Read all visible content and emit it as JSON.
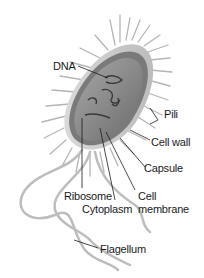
{
  "diagram": {
    "labels": {
      "dna": "DNA",
      "pili": "Pili",
      "cell_wall": "Cell wall",
      "capsule": "Capsule",
      "ribosome": "Ribosome",
      "cell_membrane_line1": "Cell",
      "cell_membrane_line2": "membrane",
      "cytoplasm": "Cytoplasm",
      "flagellum": "Flagellum"
    },
    "colors": {
      "background": "#ffffff",
      "body_fill": "#8a8a8a",
      "body_dark": "#555555",
      "capsule_light": "#cfcfcf",
      "hair": "#b0b0b0",
      "leader_line": "#1a1a1a",
      "text": "#1a1a1a"
    }
  }
}
